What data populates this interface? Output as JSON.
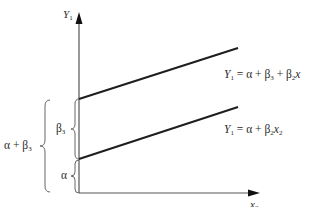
{
  "diagram": {
    "type": "dummy-variable intercept shift regression",
    "y_axis": {
      "label": "Y",
      "label_sub": "1"
    },
    "x_axis": {
      "label": "x",
      "label_sub": "2"
    },
    "lines": [
      {
        "name": "upper",
        "equation_lhs": "Y",
        "equation_lhs_sub": "1",
        "equation_rhs": "= α + β",
        "equation_rhs_sub1": "3",
        "equation_rhs_mid": " + β",
        "equation_rhs_sub2": "2",
        "equation_rhs_tail": "x",
        "intercept": "α + β3"
      },
      {
        "name": "lower",
        "equation_lhs": "Y",
        "equation_lhs_sub": "1",
        "equation_rhs": "= α + β",
        "equation_rhs_sub1": "2",
        "equation_rhs_tail": "x",
        "equation_rhs_tail_sub": "2",
        "intercept": "α"
      }
    ],
    "braces": {
      "beta3": {
        "label": "β",
        "sub": "3"
      },
      "alpha": {
        "label": "α"
      },
      "alpha_plus_beta3": {
        "label": "α + β",
        "sub": "3"
      }
    },
    "colors": {
      "line": "#1e1e1e",
      "axis": "#444444",
      "brace": "#666666",
      "text": "#2a2a2a"
    }
  }
}
